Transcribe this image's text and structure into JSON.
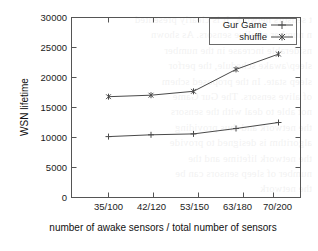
{
  "chart_data": {
    "type": "line",
    "title": "",
    "xlabel": "number of awake sensors / total number of sensors",
    "ylabel": "WSN lifetime",
    "categories": [
      "35/100",
      "42/120",
      "53/150",
      "63/180",
      "70/200"
    ],
    "ylim": [
      0,
      30000
    ],
    "yticks": [
      0,
      5000,
      10000,
      15000,
      20000,
      25000,
      30000
    ],
    "ytick_labels": [
      "0",
      "5000",
      "10000",
      "15000",
      "20000",
      "25000",
      "30000"
    ],
    "grid": false,
    "legend_position": "top-right",
    "series": [
      {
        "name": "Gur Game",
        "marker": "plus",
        "values": [
          10150,
          10450,
          10600,
          11500,
          12500
        ]
      },
      {
        "name": "shuffle",
        "marker": "cross",
        "values": [
          16800,
          17050,
          17700,
          21350,
          23900
        ]
      }
    ]
  },
  "legend": {
    "entries": [
      {
        "label": "Gur Game"
      },
      {
        "label": "shuffle"
      }
    ]
  },
  "bleed_text": "t sensors network. It is clearly presented\nn number of alive sensors. As shown\nnsiderable increase in the number\nsleep/awake schedule, the perfor\nsleep state. In the proposed schem\nof alive sensors. The Gur Game\nnot able to deal with the sensors\nthe network and thus providing\nalgorithm is designed to provide\nthe network lifetime and the\nnumber of sleep sensors can be\nthe network"
}
